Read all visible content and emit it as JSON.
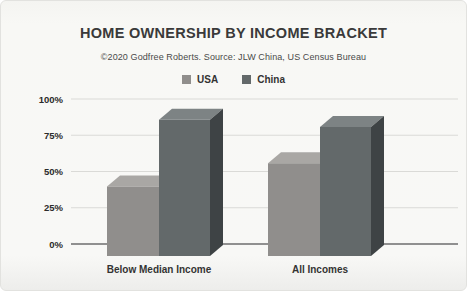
{
  "chart": {
    "title": "HOME OWNERSHIP BY INCOME BRACKET",
    "subtitle": "©2020 Godfree Roberts. Source: JLW China, US Census Bureau"
  },
  "chart_data": {
    "type": "bar",
    "style": "3d-clustered-column",
    "title": "HOME OWNERSHIP BY INCOME BRACKET",
    "subtitle": "©2020 Godfree Roberts. Source: JLW China, US Census Bureau",
    "categories": [
      "Below Median Income",
      "All Incomes"
    ],
    "series": [
      {
        "name": "USA",
        "values": [
          48,
          64
        ],
        "color_front": "#908e8c",
        "color_top": "#a9a7a4",
        "color_side": "#6f6d6b"
      },
      {
        "name": "China",
        "values": [
          94,
          89
        ],
        "color_front": "#63696a",
        "color_top": "#7d8384",
        "color_side": "#3e4345"
      }
    ],
    "xlabel": "",
    "ylabel": "",
    "ylim": [
      0,
      100
    ],
    "ytick_labels": [
      "0%",
      "25%",
      "50%",
      "75%",
      "100%"
    ],
    "ytick_values": [
      0,
      25,
      50,
      75,
      100
    ],
    "grid": true,
    "legend_position": "top",
    "colors": {
      "grid_line": "#dadad7",
      "zero_line": "#6e6e6e",
      "tick_text": "#2b2b2b",
      "category_text": "#333333"
    }
  }
}
